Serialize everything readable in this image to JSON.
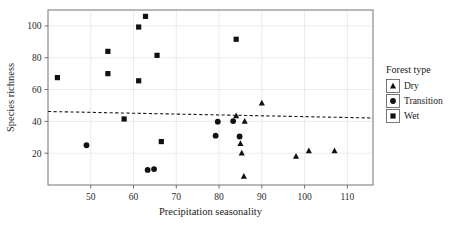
{
  "chart_data": {
    "type": "scatter",
    "title": "",
    "xlabel": "Precipitation seasonality",
    "ylabel": "Species richness",
    "xlim": [
      40,
      116
    ],
    "ylim": [
      0,
      110
    ],
    "xticks": [
      50,
      60,
      70,
      80,
      90,
      100,
      110
    ],
    "yticks": [
      20,
      40,
      60,
      80,
      100
    ],
    "xtick_labels": [
      "50",
      "60",
      "70",
      "80",
      "90",
      "100",
      "110"
    ],
    "ytick_labels": [
      "20",
      "40",
      "60",
      "80",
      "100"
    ],
    "grid": true,
    "grid_color": "#e6e6e6",
    "frame_color": "#808080",
    "marker_color": "#111111",
    "legend": {
      "title": "Forest type",
      "position": "right",
      "entries": [
        {
          "label": "Dry",
          "marker": "triangle"
        },
        {
          "label": "Transition",
          "marker": "circle"
        },
        {
          "label": "Wet",
          "marker": "square"
        }
      ]
    },
    "trendline": {
      "style": "dashed",
      "color": "#1a1a1a",
      "x_start": 40,
      "y_start": 46.2,
      "x_end": 116,
      "y_end": 42.1
    },
    "series": [
      {
        "name": "Dry",
        "marker": "triangle",
        "points": [
          {
            "x": 90.0,
            "y": 51.5
          },
          {
            "x": 84.0,
            "y": 43.5
          },
          {
            "x": 86.0,
            "y": 40.0
          },
          {
            "x": 85.0,
            "y": 26.0
          },
          {
            "x": 85.3,
            "y": 20.0
          },
          {
            "x": 85.8,
            "y": 5.5
          },
          {
            "x": 98.0,
            "y": 18.0
          },
          {
            "x": 101.0,
            "y": 21.5
          },
          {
            "x": 107.0,
            "y": 21.5
          }
        ]
      },
      {
        "name": "Transition",
        "marker": "circle",
        "points": [
          {
            "x": 79.7,
            "y": 39.8
          },
          {
            "x": 83.3,
            "y": 40.2
          },
          {
            "x": 79.2,
            "y": 31.0
          },
          {
            "x": 84.8,
            "y": 30.5
          },
          {
            "x": 49.0,
            "y": 25.0
          },
          {
            "x": 63.3,
            "y": 9.5
          },
          {
            "x": 64.8,
            "y": 10.0
          }
        ]
      },
      {
        "name": "Wet",
        "marker": "square",
        "points": [
          {
            "x": 62.8,
            "y": 106.0
          },
          {
            "x": 61.2,
            "y": 99.3
          },
          {
            "x": 84.0,
            "y": 91.6
          },
          {
            "x": 54.0,
            "y": 84.0
          },
          {
            "x": 65.5,
            "y": 81.5
          },
          {
            "x": 54.0,
            "y": 70.0
          },
          {
            "x": 42.2,
            "y": 67.5
          },
          {
            "x": 61.2,
            "y": 65.5
          },
          {
            "x": 57.8,
            "y": 41.5
          },
          {
            "x": 66.5,
            "y": 27.3
          }
        ]
      }
    ]
  }
}
